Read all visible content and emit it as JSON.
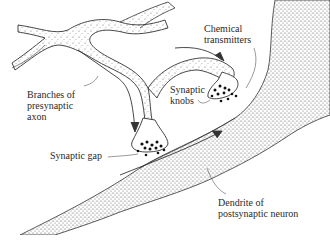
{
  "diagram": {
    "type": "anatomical-illustration",
    "labels": {
      "branches": "Branches of\npresynaptic\naxon",
      "chemical": "Chemical\ntransmitters",
      "knobs": "Synaptic\nknobs",
      "gap": "Synaptic gap",
      "dendrite": "Dendrite of\npostsynaptic neuron"
    },
    "colors": {
      "ink": "#2a2a2a",
      "stipple": "#555555",
      "background": "#ffffff"
    }
  }
}
